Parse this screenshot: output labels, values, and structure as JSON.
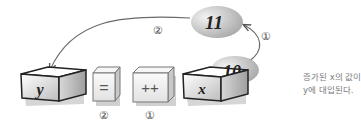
{
  "diagram": {
    "variables": {
      "y": {
        "label": "y"
      },
      "x": {
        "label": "x",
        "value": "10"
      }
    },
    "operators": {
      "assign": {
        "symbol": "=",
        "step": "②"
      },
      "increment": {
        "symbol": "++",
        "step": "①"
      }
    },
    "result_bubble": {
      "value": "11"
    },
    "arrows": {
      "increment_arrow_step": "①",
      "assign_arrow_step": "②"
    },
    "note": {
      "line1": "증가된 x의 값이",
      "line2": "y에 대입된다."
    },
    "colors": {
      "box_stroke": "#222222",
      "box_fill_light": "#f4f4f4",
      "box_fill_dark": "#bdbdbd",
      "shadow": "#cccccc",
      "arrow": "#666666",
      "bubble": "#c8c8c8",
      "note_text": "#7a7a7a"
    }
  }
}
